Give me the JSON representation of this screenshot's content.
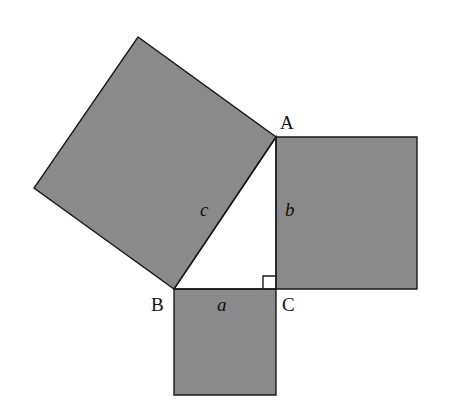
{
  "diagram": {
    "title": "",
    "fill_color": "#8a8a8a",
    "stroke_color": "#1a1a1a",
    "vertices": {
      "A": {
        "label": "A",
        "x": 276,
        "y": 137
      },
      "B": {
        "label": "B",
        "x": 174,
        "y": 289
      },
      "C": {
        "label": "C",
        "x": 276,
        "y": 289
      }
    },
    "sides": {
      "a": {
        "label": "a"
      },
      "b": {
        "label": "b"
      },
      "c": {
        "label": "c"
      }
    },
    "squares": [
      {
        "name": "square-on-c",
        "points": "276,137 174,289 34,188 138,37"
      },
      {
        "name": "square-on-b",
        "points": "276,137 417,137 417,289 276,289"
      },
      {
        "name": "square-on-a",
        "points": "174,289 276,289 276,395 174,395"
      }
    ]
  }
}
